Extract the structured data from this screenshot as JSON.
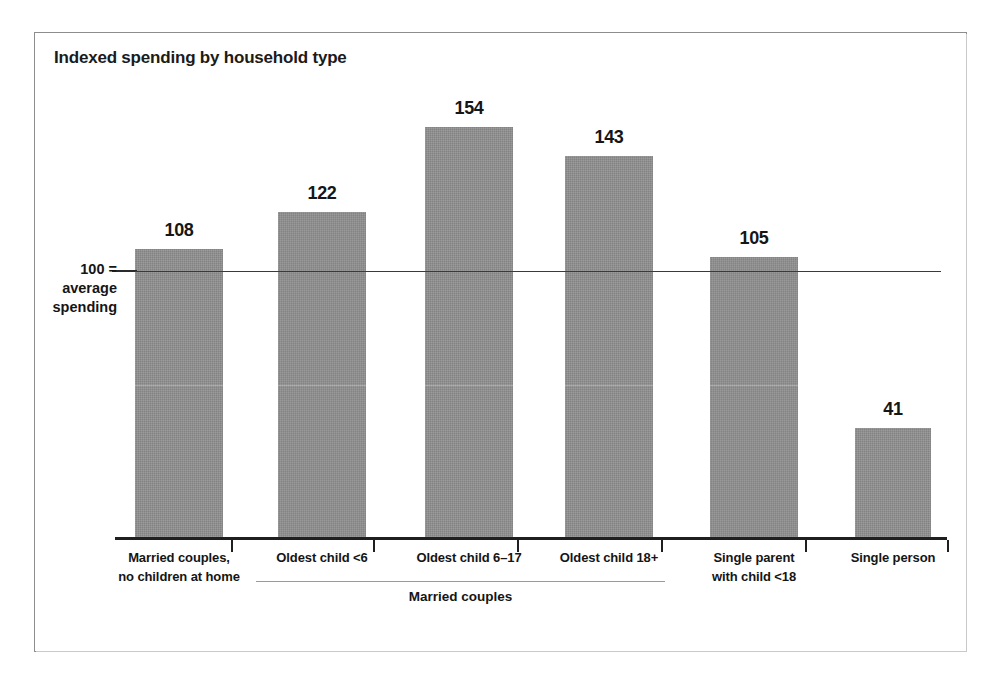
{
  "chart_data": {
    "type": "bar",
    "title": "Indexed spending by household type",
    "xlabel": "",
    "ylabel": "100 = average spending",
    "categories": [
      "Married couples, no children at home",
      "Oldest child <6",
      "Oldest child 6–17",
      "Oldest child 18+",
      "Single parent with child <18",
      "Single person"
    ],
    "category_lines": [
      [
        "Married couples,",
        "no children at home"
      ],
      [
        "Oldest child <6"
      ],
      [
        "Oldest child 6–17"
      ],
      [
        "Oldest child 18+"
      ],
      [
        "Single parent",
        "with child <18"
      ],
      [
        "Single person"
      ]
    ],
    "values": [
      108,
      122,
      154,
      143,
      105,
      41
    ],
    "value_labels": [
      "108",
      "122",
      "154",
      "143",
      "105",
      "41"
    ],
    "reference_line": {
      "value": 100,
      "label_lines": [
        "100 =",
        "average",
        "spending"
      ]
    },
    "group_bracket": {
      "label": "Married couples",
      "covers": [
        "Oldest child <6",
        "Oldest child 6–17",
        "Oldest child 18+"
      ]
    },
    "ylim": [
      0,
      165
    ],
    "grid": false,
    "legend": false,
    "colors": {
      "bar_fill": "#909090",
      "axis": "#1f1f1f",
      "reference_line": "#3a3a3a",
      "text": "#151515",
      "frame": "#8d8d8d",
      "background": "#ffffff"
    }
  }
}
